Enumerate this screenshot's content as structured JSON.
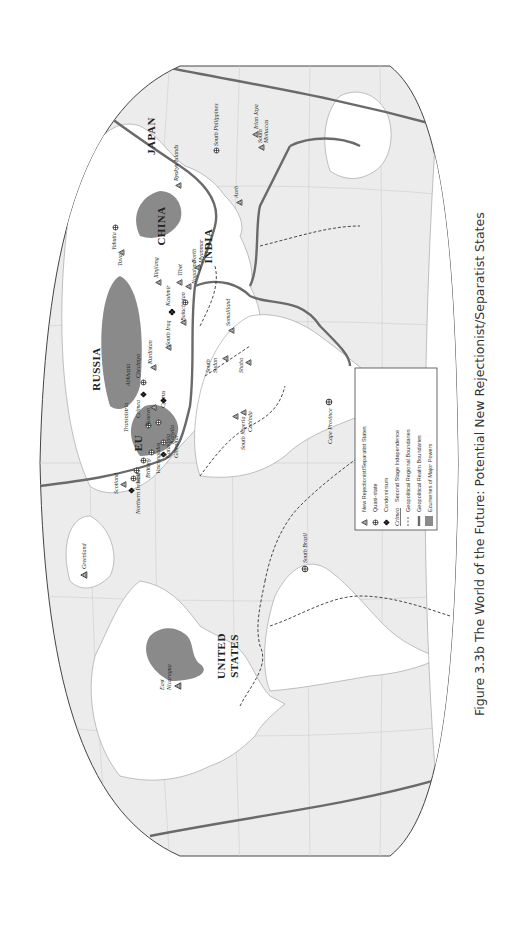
{
  "figure": {
    "caption": "Figure 3.3b   The World of the Future: Potential New Rejectionist/Separatist States",
    "orientation": "rotated 90° counter-clockwise"
  },
  "map": {
    "major_powers": [
      "UNITED STATES",
      "RUSSIA",
      "CHINA",
      "JAPAN",
      "INDIA",
      "EU"
    ],
    "major_power_lines": {
      "us_line1": "UNITED",
      "us_line2": "STATES",
      "russia": "RUSSIA",
      "china": "CHINA",
      "japan": "JAPAN",
      "india": "INDIA",
      "eu": "EU"
    },
    "places": {
      "greenland": "Greenland",
      "east_nicaragua_1": "East",
      "east_nicaragua_2": "Nicaragua",
      "south_brazil": "South Brazil",
      "scotland": "Scotland",
      "northern_ireland": "Northern Ireland",
      "wales": "Wales",
      "brittany": "Brittany",
      "vascongadas": "Vascongadas",
      "catalonia": "Catalonia",
      "gibraltar": "Gibraltar",
      "kabylia": "Kabylia",
      "cyprus": "Cyprus",
      "crimea": "Crimea",
      "transnistria": "Transnistria",
      "kosovo": "Kosovo",
      "abkhazia": "Abkhazia",
      "chechnya": "Chechnya",
      "kurdistan": "Kurdistan",
      "south_iraq": "South Iraq",
      "baluchistan": "Baluchistan",
      "kashmir": "Kashmir",
      "nagaland": "Nagaland",
      "tibet": "Tibet",
      "north_myanmar_1": "North",
      "north_myanmar_2": "Myanmar",
      "xinjiang": "Xinjiang",
      "tuva": "Tuva",
      "yakutia": "Yakutia",
      "ryukyu": "Ryukyu Islands",
      "south_philippines": "South Philippines",
      "irian_jaya": "Irian Jaya",
      "south_moluccas_1": "South",
      "south_moluccas_2": "Moluccas",
      "aceh": "Aceh",
      "somaliland": "Somaliland",
      "south_sudan_1": "South",
      "south_sudan_2": "Sudan",
      "shaba": "Shaba",
      "south_nigeria": "South Nigeria",
      "cabinda": "Cabinda",
      "cape_province": "Cape Province"
    }
  },
  "legend": {
    "items": [
      {
        "symbol": "triangle-icon",
        "label": "New Rejectionist/Separatist States"
      },
      {
        "symbol": "quasi-state-icon",
        "label": "Quasi-state"
      },
      {
        "symbol": "condominium-icon",
        "label": "Condominium"
      },
      {
        "symbol": "italic-sample",
        "sample": "Crimea",
        "label": "Second Stage Independence"
      },
      {
        "symbol": "dashed-line",
        "label": "Geopolitical Regional Boundaries"
      },
      {
        "symbol": "thick-gray-line",
        "label": "Geopolitical Realm Boundaries"
      },
      {
        "symbol": "gray-swatch",
        "label": "Ecumenes of Major Powers"
      }
    ]
  },
  "colors": {
    "ocean": "#ebebeb",
    "land": "#ffffff",
    "ecumene": "#8a8a8a",
    "realm_boundary": "#6a6a6a",
    "text": "#222222"
  }
}
